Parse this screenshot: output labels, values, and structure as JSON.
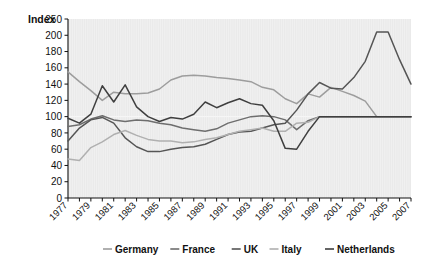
{
  "chart_data": {
    "type": "line",
    "title": "",
    "ylabel": "Index",
    "xlabel": "",
    "grid": false,
    "legend_position": "bottom",
    "xlim": [
      1977,
      2007
    ],
    "ylim": [
      0,
      250
    ],
    "x": [
      1977,
      1978,
      1979,
      1980,
      1981,
      1982,
      1983,
      1984,
      1985,
      1986,
      1987,
      1988,
      1989,
      1990,
      1991,
      1992,
      1993,
      1994,
      1995,
      1996,
      1997,
      1998,
      1999,
      2000,
      2001,
      2002,
      2003,
      2004,
      2005,
      2006,
      2007
    ],
    "xticks": [
      "1977",
      "1979",
      "1981",
      "1983",
      "1985",
      "1987",
      "1989",
      "1991",
      "1993",
      "1995",
      "1997",
      "1999",
      "2001",
      "2003",
      "2005",
      "2007"
    ],
    "yticks": [
      "0",
      "20",
      "40",
      "60",
      "80",
      "100",
      "120",
      "140",
      "160",
      "180",
      "200",
      "250"
    ],
    "series": [
      {
        "name": "Germany",
        "color": "#9d9d9d",
        "values": [
          155,
          143,
          132,
          120,
          130,
          128,
          128,
          129,
          134,
          145,
          150,
          151,
          150,
          148,
          147,
          145,
          143,
          136,
          133,
          122,
          116,
          128,
          124,
          136,
          131,
          126,
          119,
          100,
          100,
          100,
          100
        ]
      },
      {
        "name": "France",
        "color": "#6e6e6e",
        "values": [
          88,
          90,
          97,
          101,
          96,
          94,
          96,
          95,
          92,
          90,
          86,
          84,
          82,
          85,
          92,
          96,
          100,
          101,
          100,
          96,
          84,
          95,
          100,
          100,
          100,
          100,
          100,
          100,
          100,
          100,
          100
        ]
      },
      {
        "name": "UK",
        "color": "#555555",
        "values": [
          70,
          86,
          96,
          99,
          92,
          74,
          63,
          57,
          57,
          60,
          62,
          63,
          66,
          72,
          78,
          81,
          82,
          86,
          90,
          92,
          108,
          128,
          142,
          135,
          134,
          148,
          168,
          210,
          210,
          170,
          140
        ]
      },
      {
        "name": "Italy",
        "color": "#b0b0b0",
        "values": [
          48,
          46,
          62,
          69,
          78,
          83,
          77,
          72,
          70,
          70,
          68,
          69,
          72,
          74,
          78,
          82,
          84,
          86,
          82,
          82,
          92,
          93,
          100,
          100,
          100,
          100,
          100,
          100,
          100,
          100,
          100
        ]
      },
      {
        "name": "Netherlands",
        "color": "#3f3f3f",
        "values": [
          98,
          92,
          103,
          138,
          118,
          139,
          112,
          100,
          94,
          99,
          97,
          103,
          118,
          111,
          117,
          122,
          116,
          114,
          95,
          61,
          60,
          82,
          100,
          100,
          100,
          100,
          100,
          100,
          100,
          100,
          100
        ]
      }
    ]
  }
}
